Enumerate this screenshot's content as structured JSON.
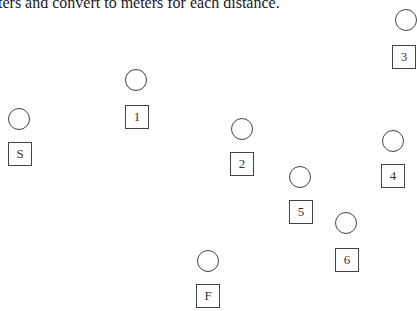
{
  "caption": "ters and convert to meters for each distance.",
  "stations": [
    {
      "label": "3",
      "circle": {
        "x": 395,
        "y": 9
      },
      "box": {
        "x": 392,
        "y": 45
      }
    },
    {
      "label": "S",
      "circle": {
        "x": 8,
        "y": 108
      },
      "box": {
        "x": 8,
        "y": 142
      }
    },
    {
      "label": "1",
      "circle": {
        "x": 125,
        "y": 69
      },
      "box": {
        "x": 125,
        "y": 105
      }
    },
    {
      "label": "2",
      "circle": {
        "x": 231,
        "y": 118
      },
      "box": {
        "x": 230,
        "y": 152
      }
    },
    {
      "label": "5",
      "circle": {
        "x": 289,
        "y": 166
      },
      "box": {
        "x": 289,
        "y": 200
      }
    },
    {
      "label": "4",
      "circle": {
        "x": 382,
        "y": 130
      },
      "box": {
        "x": 381,
        "y": 164
      }
    },
    {
      "label": "6",
      "circle": {
        "x": 335,
        "y": 212
      },
      "box": {
        "x": 335,
        "y": 248
      }
    },
    {
      "label": "F",
      "circle": {
        "x": 197,
        "y": 250
      },
      "box": {
        "x": 196,
        "y": 284
      }
    }
  ]
}
